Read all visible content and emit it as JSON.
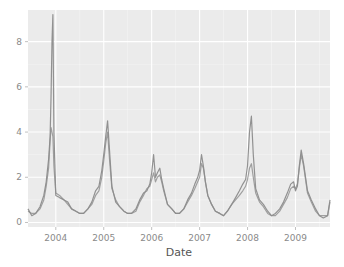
{
  "chart_data": {
    "type": "line",
    "title": "",
    "xlabel": "Date",
    "ylabel": "",
    "xlim": [
      2003.42,
      2009.72
    ],
    "ylim": [
      -0.2,
      9.4
    ],
    "x_ticks": [
      2004,
      2005,
      2006,
      2007,
      2008,
      2009
    ],
    "x_tick_labels": [
      "2004",
      "2005",
      "2006",
      "2007",
      "2008",
      "2009"
    ],
    "y_ticks": [
      0,
      2,
      4,
      6,
      8
    ],
    "y_tick_labels": [
      "0",
      "2",
      "4",
      "6",
      "8"
    ],
    "grid": true,
    "legend": null,
    "colors": {
      "panel": "#ebebeb",
      "grid": "#ffffff",
      "line": "#8c8c8c",
      "tick_text": "#8a8a8a"
    },
    "series": [
      {
        "name": "series-a",
        "x": [
          2003.42,
          2003.5,
          2003.58,
          2003.67,
          2003.75,
          2003.8,
          2003.85,
          2003.88,
          2003.9,
          2003.92,
          2003.94,
          2003.96,
          2004.0,
          2004.08,
          2004.17,
          2004.25,
          2004.33,
          2004.42,
          2004.5,
          2004.58,
          2004.67,
          2004.75,
          2004.83,
          2004.9,
          2004.96,
          2005.0,
          2005.04,
          2005.08,
          2005.12,
          2005.17,
          2005.25,
          2005.33,
          2005.42,
          2005.5,
          2005.58,
          2005.67,
          2005.75,
          2005.83,
          2005.9,
          2005.96,
          2006.0,
          2006.04,
          2006.08,
          2006.12,
          2006.17,
          2006.21,
          2006.25,
          2006.33,
          2006.42,
          2006.5,
          2006.58,
          2006.67,
          2006.75,
          2006.83,
          2006.9,
          2006.96,
          2007.0,
          2007.04,
          2007.08,
          2007.12,
          2007.17,
          2007.25,
          2007.33,
          2007.42,
          2007.5,
          2007.58,
          2007.67,
          2007.75,
          2007.83,
          2007.9,
          2007.96,
          2008.0,
          2008.04,
          2008.08,
          2008.12,
          2008.17,
          2008.25,
          2008.33,
          2008.42,
          2008.5,
          2008.58,
          2008.67,
          2008.75,
          2008.83,
          2008.9,
          2008.96,
          2009.0,
          2009.04,
          2009.08,
          2009.12,
          2009.17,
          2009.25,
          2009.33,
          2009.42,
          2009.5,
          2009.58,
          2009.67,
          2009.72
        ],
        "values": [
          0.6,
          0.3,
          0.4,
          0.7,
          1.2,
          1.8,
          2.8,
          3.8,
          5.5,
          8.0,
          9.2,
          4.0,
          1.2,
          1.1,
          1.0,
          0.9,
          0.6,
          0.5,
          0.4,
          0.4,
          0.6,
          0.9,
          1.4,
          1.6,
          2.3,
          3.0,
          3.8,
          4.5,
          3.2,
          1.6,
          0.9,
          0.7,
          0.5,
          0.4,
          0.4,
          0.6,
          1.0,
          1.3,
          1.4,
          1.7,
          2.2,
          3.0,
          2.0,
          2.2,
          2.4,
          1.9,
          1.5,
          0.8,
          0.6,
          0.4,
          0.4,
          0.6,
          1.0,
          1.3,
          1.7,
          2.0,
          2.3,
          3.0,
          2.5,
          1.8,
          1.2,
          0.8,
          0.5,
          0.4,
          0.3,
          0.5,
          0.8,
          1.1,
          1.4,
          1.7,
          1.9,
          2.5,
          4.0,
          4.7,
          3.0,
          1.5,
          1.0,
          0.8,
          0.5,
          0.3,
          0.4,
          0.6,
          0.9,
          1.3,
          1.7,
          1.8,
          1.4,
          1.6,
          2.5,
          3.2,
          2.6,
          1.4,
          1.0,
          0.6,
          0.3,
          0.2,
          0.3,
          1.0
        ]
      },
      {
        "name": "series-b",
        "x": [
          2003.42,
          2003.5,
          2003.58,
          2003.67,
          2003.75,
          2003.8,
          2003.85,
          2003.88,
          2003.9,
          2003.92,
          2003.94,
          2003.96,
          2004.0,
          2004.08,
          2004.17,
          2004.25,
          2004.33,
          2004.42,
          2004.5,
          2004.58,
          2004.67,
          2004.75,
          2004.83,
          2004.9,
          2004.96,
          2005.0,
          2005.04,
          2005.08,
          2005.12,
          2005.17,
          2005.25,
          2005.33,
          2005.42,
          2005.5,
          2005.58,
          2005.67,
          2005.75,
          2005.83,
          2005.9,
          2005.96,
          2006.0,
          2006.04,
          2006.08,
          2006.12,
          2006.17,
          2006.21,
          2006.25,
          2006.33,
          2006.42,
          2006.5,
          2006.58,
          2006.67,
          2006.75,
          2006.83,
          2006.9,
          2006.96,
          2007.0,
          2007.04,
          2007.08,
          2007.12,
          2007.17,
          2007.25,
          2007.33,
          2007.42,
          2007.5,
          2007.58,
          2007.67,
          2007.75,
          2007.83,
          2007.9,
          2007.96,
          2008.0,
          2008.04,
          2008.08,
          2008.12,
          2008.17,
          2008.25,
          2008.33,
          2008.42,
          2008.5,
          2008.58,
          2008.67,
          2008.75,
          2008.83,
          2008.9,
          2008.96,
          2009.0,
          2009.04,
          2009.08,
          2009.12,
          2009.17,
          2009.25,
          2009.33,
          2009.42,
          2009.5,
          2009.58,
          2009.67,
          2009.72
        ],
        "values": [
          0.5,
          0.4,
          0.4,
          0.6,
          1.0,
          1.6,
          2.4,
          3.6,
          4.2,
          4.0,
          3.8,
          2.5,
          1.3,
          1.2,
          1.0,
          0.8,
          0.6,
          0.5,
          0.4,
          0.4,
          0.6,
          0.8,
          1.2,
          1.4,
          2.0,
          2.7,
          3.5,
          4.0,
          2.8,
          1.5,
          1.0,
          0.7,
          0.5,
          0.4,
          0.4,
          0.5,
          0.9,
          1.2,
          1.5,
          1.6,
          1.9,
          2.2,
          1.8,
          2.0,
          2.1,
          1.8,
          1.4,
          0.8,
          0.6,
          0.4,
          0.4,
          0.6,
          0.9,
          1.2,
          1.5,
          1.8,
          2.0,
          2.6,
          2.4,
          1.8,
          1.2,
          0.8,
          0.5,
          0.4,
          0.3,
          0.5,
          0.8,
          1.0,
          1.2,
          1.4,
          1.6,
          1.9,
          2.4,
          2.6,
          2.0,
          1.3,
          0.9,
          0.7,
          0.4,
          0.3,
          0.3,
          0.5,
          0.8,
          1.1,
          1.5,
          1.6,
          1.5,
          1.7,
          2.4,
          3.0,
          2.5,
          1.3,
          0.9,
          0.5,
          0.3,
          0.3,
          0.3,
          0.9
        ]
      }
    ]
  }
}
